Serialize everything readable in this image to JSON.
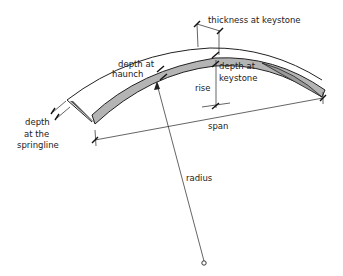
{
  "diagram": {
    "type": "arch-bridge-nomenclature",
    "colors": {
      "arch_fill": "#b4b4b4",
      "arch_side_fill": "#9a9a9a",
      "line": "#222222",
      "background": "#ffffff"
    },
    "labels": {
      "thickness_at_keystone": "thickness at keystone",
      "depth_at_haunch_line1": "depth at",
      "depth_at_haunch_line2": "haunch",
      "depth_at_keystone_line1": "depth at",
      "depth_at_keystone_line2": "keystone",
      "rise": "rise",
      "span": "span",
      "radius": "radius",
      "depth_springline_line1": "depth",
      "depth_springline_line2": "at the",
      "depth_springline_line3": "springline"
    }
  }
}
